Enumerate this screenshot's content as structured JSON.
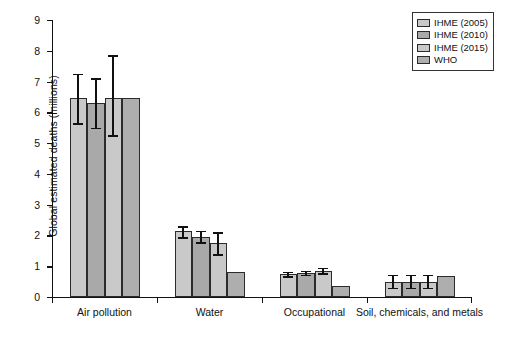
{
  "chart_data": {
    "type": "bar",
    "title": "",
    "subtitle": "",
    "xlabel": "",
    "ylabel": "Global estimated deaths (millions)",
    "ylim": [
      0,
      9
    ],
    "ytick_labels": [
      "0",
      "1",
      "2",
      "3",
      "4",
      "5",
      "6",
      "7",
      "8",
      "9"
    ],
    "ytick_values": [
      0,
      1,
      2,
      3,
      4,
      5,
      6,
      7,
      8,
      9
    ],
    "grid": false,
    "legend_position": "top-right",
    "categories": [
      "Air pollution",
      "Water",
      "Occupational",
      "Soil, chemicals, and metals"
    ],
    "series": [
      {
        "name": "IHME (2005)",
        "color": "#c9c9c9",
        "values": [
          6.45,
          2.15,
          0.75,
          0.5
        ],
        "error_low": [
          5.65,
          1.95,
          0.68,
          0.3
        ],
        "error_high": [
          7.25,
          2.3,
          0.82,
          0.72
        ]
      },
      {
        "name": "IHME (2010)",
        "color": "#a9a9a9",
        "values": [
          6.3,
          1.95,
          0.78,
          0.5
        ],
        "error_low": [
          5.5,
          1.78,
          0.72,
          0.3
        ],
        "error_high": [
          7.1,
          2.15,
          0.85,
          0.72
        ]
      },
      {
        "name": "IHME (2015)",
        "color": "#c9c9c9",
        "values": [
          6.47,
          1.75,
          0.85,
          0.5
        ],
        "error_low": [
          5.25,
          1.4,
          0.78,
          0.3
        ],
        "error_high": [
          7.85,
          2.1,
          0.95,
          0.72
        ]
      },
      {
        "name": "WHO",
        "color": "#aeaeae",
        "values": [
          6.48,
          0.82,
          0.35,
          0.68
        ],
        "error_low": [
          null,
          null,
          null,
          null
        ],
        "error_high": [
          null,
          null,
          null,
          null
        ]
      }
    ]
  },
  "legend": {
    "items": [
      {
        "label": "IHME (2005)",
        "color": "#c9c9c9"
      },
      {
        "label": "IHME (2010)",
        "color": "#a9a9a9"
      },
      {
        "label": "IHME (2015)",
        "color": "#c9c9c9"
      },
      {
        "label": "WHO",
        "color": "#aeaeae"
      }
    ]
  },
  "axes": {
    "y_title": "Global estimated deaths (millions)"
  }
}
